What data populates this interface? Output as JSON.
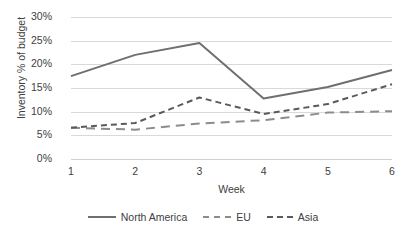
{
  "chart_data": {
    "type": "line",
    "title": "",
    "xlabel": "Week",
    "ylabel": "Inventory % of budget",
    "categories": [
      "1",
      "2",
      "3",
      "4",
      "5",
      "6"
    ],
    "x": [
      1,
      2,
      3,
      4,
      5,
      6
    ],
    "ylim": [
      0,
      30
    ],
    "ytick_labels": [
      "0%",
      "5%",
      "10%",
      "15%",
      "20%",
      "25%",
      "30%"
    ],
    "ytick_values": [
      0,
      5,
      10,
      15,
      20,
      25,
      30
    ],
    "grid": true,
    "legend_position": "bottom",
    "series": [
      {
        "name": "North America",
        "style": "solid",
        "color": "#6f6f6f",
        "values": [
          17.5,
          22.0,
          24.5,
          12.8,
          15.2,
          18.8
        ]
      },
      {
        "name": "EU",
        "style": "dashed-long",
        "color": "#8c8c8c",
        "values": [
          6.6,
          6.2,
          7.5,
          8.2,
          9.8,
          10.1
        ]
      },
      {
        "name": "Asia",
        "style": "dashed-short",
        "color": "#5a5a5a",
        "values": [
          6.6,
          7.6,
          13.0,
          9.5,
          11.6,
          15.8
        ]
      }
    ]
  },
  "legend": {
    "items": [
      {
        "label": "North America",
        "style": "solid"
      },
      {
        "label": "EU",
        "style": "dashed-long"
      },
      {
        "label": "Asia",
        "style": "dashed-short"
      }
    ]
  },
  "colors": {
    "gridline": "#d9d9d9",
    "text": "#404040",
    "background": "#ffffff"
  }
}
